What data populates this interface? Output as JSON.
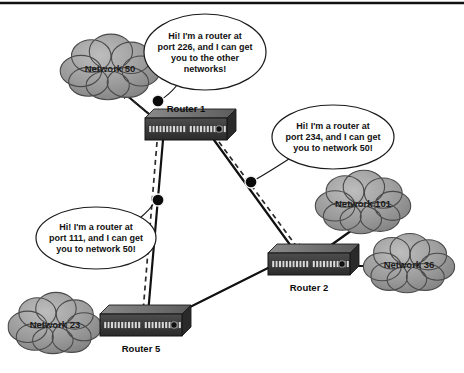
{
  "figure": {
    "top_rule_color": "#111111",
    "background": "#ffffff"
  },
  "palette": {
    "cloud_fill": "#9a9a9a",
    "cloud_edge": "#4a4a4a",
    "router_top": "#6e6e6e",
    "router_face": "#3a3a3a",
    "router_side": "#2a2a2a",
    "port_color": "#d8d8d8",
    "link_color": "#111111",
    "dashed_color": "#2a2a2a",
    "bubble_fill": "#ffffff",
    "bubble_edge": "#1a1a1a",
    "dot_color": "#0a0a0a"
  },
  "clouds": [
    {
      "id": "network-50",
      "label": "Network 50",
      "cx": 110,
      "cy": 68,
      "rx": 47,
      "ry": 30
    },
    {
      "id": "network-101",
      "label": "Network 101",
      "cx": 363,
      "cy": 203,
      "rx": 45,
      "ry": 29
    },
    {
      "id": "network-36",
      "label": "Network 36",
      "cx": 409,
      "cy": 264,
      "rx": 43,
      "ry": 27
    },
    {
      "id": "network-23",
      "label": "Network 23",
      "cx": 55,
      "cy": 324,
      "rx": 44,
      "ry": 28
    }
  ],
  "routers": [
    {
      "id": "router-1",
      "label": "Router 1",
      "x": 145,
      "y": 118,
      "w": 82,
      "h": 22,
      "label_x": 186,
      "label_y": 112,
      "label_anchor": "middle"
    },
    {
      "id": "router-2",
      "label": "Router 2",
      "x": 268,
      "y": 253,
      "w": 82,
      "h": 22,
      "label_x": 309,
      "label_y": 291,
      "label_anchor": "middle"
    },
    {
      "id": "router-5",
      "label": "Router 5",
      "x": 100,
      "y": 314,
      "w": 82,
      "h": 22,
      "label_x": 141,
      "label_y": 352,
      "label_anchor": "middle"
    }
  ],
  "links": [
    {
      "id": "link-router1-network50",
      "from": "router-1",
      "to": "network-50",
      "x1": 156,
      "y1": 120,
      "x2": 118,
      "y2": 88
    },
    {
      "id": "link-router1-router5",
      "from": "router-1",
      "to": "router-5",
      "x1": 163,
      "y1": 140,
      "x2": 148,
      "y2": 314
    },
    {
      "id": "link-router1-router2",
      "from": "router-1",
      "to": "router-2",
      "x1": 214,
      "y1": 140,
      "x2": 296,
      "y2": 253
    },
    {
      "id": "link-router2-network101",
      "from": "router-2",
      "to": "network-101",
      "x1": 320,
      "y1": 253,
      "x2": 355,
      "y2": 228
    },
    {
      "id": "link-router2-network36",
      "from": "router-2",
      "to": "network-36",
      "x1": 350,
      "y1": 266,
      "x2": 374,
      "y2": 266
    },
    {
      "id": "link-router2-router5",
      "from": "router-2",
      "to": "router-5",
      "x1": 268,
      "y1": 268,
      "x2": 176,
      "y2": 314
    },
    {
      "id": "link-router5-network23",
      "from": "router-5",
      "to": "network-23",
      "x1": 100,
      "y1": 325,
      "x2": 90,
      "y2": 325
    }
  ],
  "advertisements": [
    {
      "id": "advert-to-network50",
      "note": "dashed arrow from Router 1 toward Network 50",
      "x1": 158,
      "y1": 121,
      "x2": 122,
      "y2": 92
    },
    {
      "id": "advert-to-router5",
      "note": "dashed arrow from Router 1 down to Router 5",
      "x1": 157,
      "y1": 142,
      "x2": 143,
      "y2": 312
    },
    {
      "id": "advert-to-router2",
      "note": "dashed arrow from Router 1 to Router 2",
      "x1": 219,
      "y1": 142,
      "x2": 300,
      "y2": 251
    }
  ],
  "bubbles": [
    {
      "id": "bubble-router1-port226",
      "lines": [
        "Hi! I'm a router at",
        "port 226, and I can get",
        "you to the other",
        "networks!"
      ],
      "cx": 205,
      "cy": 52,
      "rx": 61,
      "ry": 38,
      "anchor_x": 158,
      "anchor_y": 101,
      "tail": "M 178,84 C 170,94 164,98 160,100"
    },
    {
      "id": "bubble-router1-port234",
      "lines": [
        "Hi! I'm a router at",
        "port 234, and I can get",
        "you to network 50!"
      ],
      "cx": 333,
      "cy": 137,
      "rx": 61,
      "ry": 32,
      "anchor_x": 251,
      "anchor_y": 182,
      "tail": "M 292,157 C 275,168 262,176 253,181"
    },
    {
      "id": "bubble-router5-port111",
      "lines": [
        "Hi! I'm a router at",
        "port 111, and I can get",
        "you to network 50!"
      ],
      "cx": 96,
      "cy": 238,
      "rx": 60,
      "ry": 31,
      "anchor_x": 158,
      "anchor_y": 200,
      "tail": "M 140,218 C 152,208 154,203 156,200"
    }
  ],
  "dots": [
    {
      "id": "bubble-dot-port226",
      "cx": 158,
      "cy": 101,
      "r": 6
    },
    {
      "id": "bubble-dot-port234",
      "cx": 251,
      "cy": 182,
      "r": 6
    },
    {
      "id": "bubble-dot-port111",
      "cx": 158,
      "cy": 200,
      "r": 6
    }
  ]
}
